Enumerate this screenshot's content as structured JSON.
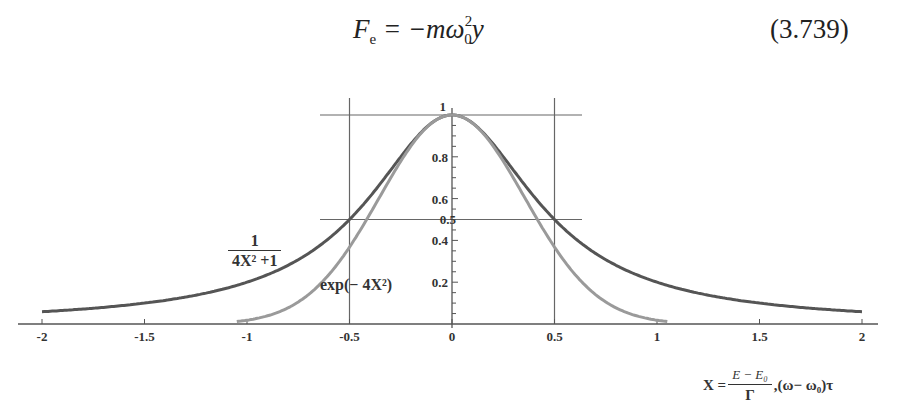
{
  "equation": {
    "lhs": "F",
    "lhs_sub": "e",
    "rhs_prefix": " = −mω",
    "rhs_sub": "0",
    "rhs_sup": "2",
    "rhs_suffix": "y",
    "number": "(3.739)"
  },
  "chart_data": {
    "type": "line",
    "title": "",
    "xlabel": "X = (E − E0)/Γ, (ω − ω0)τ",
    "ylabel": "",
    "xlim": [
      -2,
      2
    ],
    "ylim": [
      0,
      1
    ],
    "x_ticks": [
      "-2",
      "-1.5",
      "-1",
      "-0.5",
      "0",
      "0.5",
      "1",
      "1.5",
      "2"
    ],
    "y_ticks": [
      "0.2",
      "0.4",
      "0.5",
      "0.6",
      "0.8",
      "1"
    ],
    "grid": "reference lines at x=±0.5, y=0.5, y=1",
    "series": [
      {
        "name": "1/(4X^2+1)",
        "color": "#555555",
        "x": [
          -2,
          -1.5,
          -1,
          -0.75,
          -0.5,
          -0.25,
          0,
          0.25,
          0.5,
          0.75,
          1,
          1.5,
          2
        ],
        "values": [
          0.059,
          0.1,
          0.2,
          0.308,
          0.5,
          0.8,
          1.0,
          0.8,
          0.5,
          0.308,
          0.2,
          0.1,
          0.059
        ]
      },
      {
        "name": "exp(-4X^2)",
        "color": "#9a9a9a",
        "x": [
          -2,
          -1.5,
          -1,
          -0.75,
          -0.5,
          -0.25,
          0,
          0.25,
          0.5,
          0.75,
          1,
          1.5,
          2
        ],
        "values": [
          0.0,
          0.0001,
          0.018,
          0.105,
          0.368,
          0.779,
          1.0,
          0.779,
          0.368,
          0.105,
          0.018,
          0.0001,
          0.0
        ]
      }
    ]
  },
  "labels": {
    "lorentz_num": "1",
    "lorentz_den": "4X² +1",
    "gauss": "exp(− 4X²)",
    "xlabel_prefix": "X =",
    "xlabel_num": "E − E₀",
    "xlabel_den": "Γ",
    "xlabel_suffix": ",(ω− ω₀)τ"
  },
  "colors": {
    "lorentz": "#555555",
    "gauss": "#9a9a9a",
    "axis": "#555555",
    "grid": "#666666"
  }
}
